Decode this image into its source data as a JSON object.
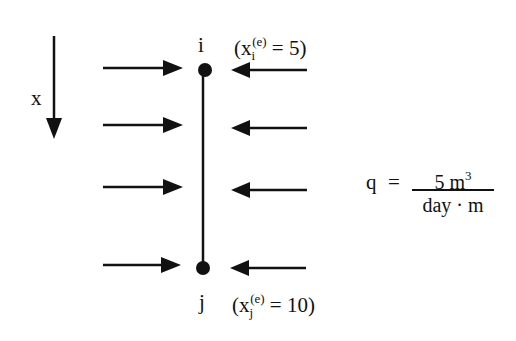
{
  "diagram": {
    "axis": {
      "label": "x",
      "direction": "down"
    },
    "node_i": {
      "name": "i",
      "coord_prefix": "(x",
      "sub": "i",
      "sup": "(e)",
      "coord_suffix": " = 5)",
      "value": 5
    },
    "node_j": {
      "name": "j",
      "coord_prefix": "(x",
      "sub": "j",
      "sup": "(e)",
      "coord_suffix": " = 10)",
      "value": 10
    },
    "load": {
      "symbol": "q",
      "equals": "=",
      "numerator": "5 m",
      "numerator_exp": "3",
      "denominator": "day · m"
    },
    "arrows": {
      "left_count": 4,
      "right_count": 4
    },
    "colors": {
      "ink": "#111111",
      "background": "#ffffff"
    }
  }
}
